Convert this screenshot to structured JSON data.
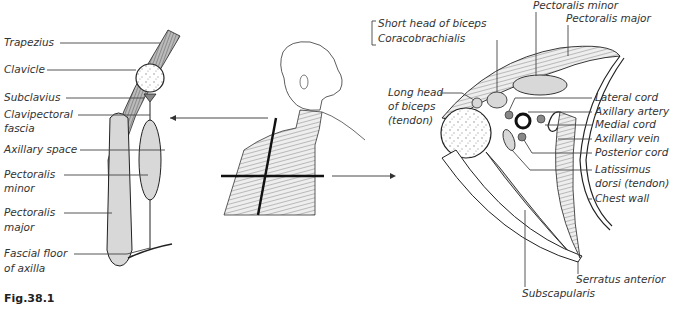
{
  "figure": {
    "caption": "Fig.38.1",
    "colors": {
      "muscle_fill": "#d8d8d8",
      "bone_fill": "#ffffff",
      "line": "#222222",
      "vessel_fill": "#888888"
    }
  },
  "left_panel": {
    "title": "Sagittal section of axilla",
    "labels": [
      "Trapezius",
      "Clavicle",
      "Subclavius",
      "Clavipectoral",
      "fascia",
      "Axillary space",
      "Pectoralis",
      "minor",
      "Pectoralis",
      "major",
      "Fascial floor",
      "of axilla"
    ]
  },
  "center_panel": {
    "description": "Figure of head and shoulder with section planes",
    "arrows": [
      "left",
      "right"
    ]
  },
  "right_panel": {
    "title": "Horizontal section of axilla",
    "labels_left": [
      "Short head of biceps",
      "Coracobrachialis",
      "Long head",
      "of biceps",
      "(tendon)"
    ],
    "labels_top": [
      "Pectoralis minor",
      "Pectoralis major"
    ],
    "labels_right": [
      "Lateral cord",
      "Axillary artery",
      "Medial cord",
      "Axillary vein",
      "Posterior cord",
      "Latissimus",
      "dorsi (tendon)",
      "Chest wall"
    ],
    "labels_bottom": [
      "Serratus anterior",
      "Subscapularis"
    ]
  }
}
